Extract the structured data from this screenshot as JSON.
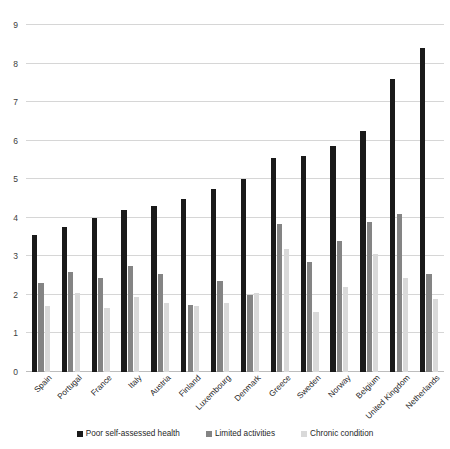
{
  "chart_data": {
    "type": "bar",
    "title": "",
    "xlabel": "",
    "ylabel": "",
    "ylim": [
      0,
      9
    ],
    "yticks": [
      0,
      1,
      2,
      3,
      4,
      5,
      6,
      7,
      8,
      9
    ],
    "grid": true,
    "legend_position": "bottom",
    "categories": [
      "Spain",
      "Portugal",
      "France",
      "Italy",
      "Austria",
      "Finland",
      "Luxembourg",
      "Denmark",
      "Greece",
      "Sweden",
      "Norway",
      "Belgium",
      "United Kingdom",
      "Netherlands"
    ],
    "series": [
      {
        "name": "Poor self-assessed health",
        "color": "#1a1a1a",
        "values": [
          3.55,
          3.75,
          4.0,
          4.2,
          4.3,
          4.5,
          4.75,
          5.0,
          5.55,
          5.6,
          5.85,
          6.25,
          7.6,
          8.4
        ]
      },
      {
        "name": "Limited activities",
        "color": "#848484",
        "values": [
          2.3,
          2.6,
          2.45,
          2.75,
          2.55,
          1.75,
          2.35,
          2.0,
          3.85,
          2.85,
          3.4,
          3.9,
          4.1,
          2.55
        ]
      },
      {
        "name": "Chronic condition",
        "color": "#d9d9d9",
        "values": [
          1.7,
          2.05,
          1.65,
          1.95,
          1.8,
          1.7,
          1.8,
          2.05,
          3.2,
          1.55,
          2.2,
          3.05,
          2.45,
          1.9
        ]
      }
    ]
  },
  "legend": {
    "items": [
      {
        "label": "Poor self-assessed health",
        "color": "#1a1a1a"
      },
      {
        "label": "Limited activities",
        "color": "#848484"
      },
      {
        "label": "Chronic condition",
        "color": "#d9d9d9"
      }
    ]
  }
}
